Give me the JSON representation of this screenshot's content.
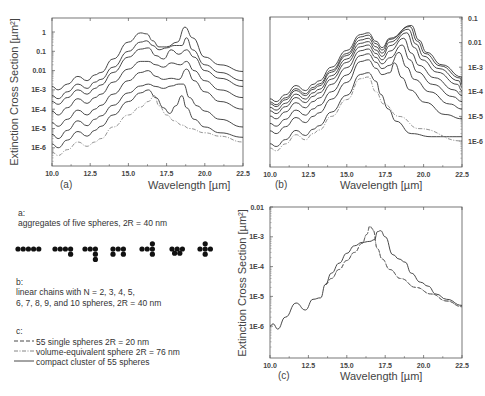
{
  "chart_data": [
    {
      "id": "a",
      "type": "line",
      "panel_label": "(a)",
      "xlabel": "Wavelength [µm]",
      "ylabel": "Extinction Cross Section [µm²]",
      "xlim": [
        10.0,
        22.5
      ],
      "yscale": "log",
      "ylim": [
        3e-07,
        3
      ],
      "x_ticks": [
        "10.0",
        "12.5",
        "15.0",
        "17.5",
        "20.0",
        "22.5"
      ],
      "y_ticks": [
        "1",
        "0.1",
        "0.01",
        "1E-3",
        "1E-4",
        "1E-5",
        "1E-6"
      ],
      "y_axis_side": "left",
      "note": "aggregates of five spheres, curves vertically offset by decades",
      "series": [
        {
          "name": "aggregate 1",
          "style": "solid",
          "x": [
            10.0,
            10.4,
            11.0,
            11.7,
            12.3,
            12.8,
            13.2,
            14.0,
            15.0,
            15.8,
            16.2,
            16.6,
            17.0,
            17.5,
            18.2,
            18.7,
            19.2,
            20.0,
            21.0,
            22.5
          ],
          "y": [
            0.0015,
            0.001,
            0.002,
            0.005,
            0.003,
            0.006,
            0.008,
            0.04,
            0.3,
            0.9,
            0.8,
            0.35,
            0.17,
            0.17,
            0.3,
            1.8,
            0.5,
            0.05,
            0.02,
            0.009
          ]
        },
        {
          "name": "aggregate 2",
          "style": "solid",
          "x": [
            10.0,
            10.4,
            11.0,
            11.7,
            12.3,
            12.8,
            13.2,
            14.0,
            15.0,
            15.8,
            16.2,
            16.6,
            17.0,
            17.5,
            18.0,
            18.5,
            18.8,
            19.2,
            20.0,
            21.0,
            22.5
          ],
          "y": [
            0.0005,
            0.00035,
            0.0008,
            0.002,
            0.0012,
            0.0025,
            0.0035,
            0.015,
            0.1,
            0.3,
            0.35,
            0.2,
            0.12,
            0.15,
            0.2,
            0.2,
            0.5,
            0.12,
            0.02,
            0.008,
            0.003
          ]
        },
        {
          "name": "aggregate 3",
          "style": "solid",
          "x": [
            10.0,
            10.4,
            11.0,
            11.7,
            12.3,
            12.8,
            13.2,
            14.0,
            15.0,
            15.8,
            16.3,
            16.8,
            17.3,
            17.8,
            18.3,
            18.8,
            19.3,
            20.0,
            21.0,
            22.5
          ],
          "y": [
            0.00025,
            0.00018,
            0.0004,
            0.001,
            0.0006,
            0.0012,
            0.0018,
            0.008,
            0.05,
            0.13,
            0.15,
            0.06,
            0.04,
            0.12,
            0.07,
            0.12,
            0.05,
            0.01,
            0.004,
            0.0015
          ]
        },
        {
          "name": "aggregate 4",
          "style": "solid",
          "x": [
            10.0,
            10.4,
            11.0,
            11.7,
            12.3,
            12.8,
            13.2,
            14.0,
            15.0,
            15.8,
            16.3,
            16.8,
            17.3,
            17.8,
            18.4,
            18.8,
            19.3,
            20.0,
            21.0,
            22.5
          ],
          "y": [
            8e-05,
            5e-05,
            0.00012,
            0.00035,
            0.0002,
            0.0004,
            0.0006,
            0.0025,
            0.012,
            0.03,
            0.03,
            0.02,
            0.015,
            0.025,
            0.02,
            0.03,
            0.01,
            0.003,
            0.001,
            0.0004
          ]
        },
        {
          "name": "aggregate 5",
          "style": "solid",
          "x": [
            10.0,
            10.4,
            11.0,
            11.7,
            12.3,
            12.8,
            13.2,
            14.0,
            15.0,
            15.8,
            16.3,
            16.8,
            17.3,
            17.8,
            18.3,
            18.8,
            19.3,
            20.0,
            21.0,
            22.5
          ],
          "y": [
            2e-05,
            1.3e-05,
            3e-05,
            9e-05,
            5e-05,
            0.0001,
            0.00016,
            0.0006,
            0.003,
            0.008,
            0.01,
            0.005,
            0.0035,
            0.004,
            0.0035,
            0.012,
            0.003,
            0.0008,
            0.00025,
            0.0001
          ]
        },
        {
          "name": "aggregate 6",
          "style": "solid",
          "x": [
            10.0,
            10.4,
            11.0,
            11.7,
            12.3,
            12.8,
            13.2,
            14.0,
            15.0,
            15.8,
            16.3,
            16.8,
            17.3,
            17.8,
            18.3,
            18.6,
            19.0,
            19.5,
            20.0,
            21.0,
            22.5
          ],
          "y": [
            5e-06,
            3e-06,
            8e-06,
            2.5e-05,
            1.4e-05,
            3e-05,
            4.5e-05,
            0.00016,
            0.0007,
            0.0016,
            0.002,
            0.0015,
            0.0012,
            0.0016,
            0.002,
            0.002,
            0.0004,
            0.00015,
            8e-05,
            3e-05,
            1.2e-05
          ]
        },
        {
          "name": "aggregate 7 (chain)",
          "style": "solid",
          "x": [
            10.0,
            10.4,
            11.0,
            11.7,
            12.3,
            12.8,
            13.2,
            14.0,
            15.0,
            15.8,
            16.3,
            16.8,
            17.3,
            17.7,
            18.1,
            18.5,
            18.8,
            19.3,
            20.0,
            21.0,
            22.5
          ],
          "y": [
            1.6e-06,
            1e-06,
            2.5e-06,
            7e-06,
            4e-06,
            8e-06,
            1.3e-05,
            5e-05,
            0.00025,
            0.0007,
            0.001,
            0.0004,
            0.00012,
            6e-05,
            0.00015,
            0.0005,
            0.00012,
            3e-05,
            1.2e-05,
            6e-06,
            3.5e-06
          ]
        },
        {
          "name": "reference sphere",
          "style": "dashdot",
          "x": [
            10.0,
            10.4,
            11.0,
            11.7,
            12.3,
            12.8,
            13.2,
            14.0,
            15.0,
            15.8,
            16.3,
            16.7,
            17.0,
            17.5,
            18.0,
            18.5,
            19.0,
            20.0,
            21.0,
            22.5
          ],
          "y": [
            6e-07,
            4e-07,
            8e-07,
            2e-06,
            1.2e-06,
            2e-06,
            3e-06,
            1.2e-05,
            5e-05,
            0.00013,
            0.00025,
            0.0005,
            0.00015,
            5e-05,
            2.5e-05,
            1.5e-05,
            1e-05,
            6e-06,
            4e-06,
            2e-06
          ]
        }
      ]
    },
    {
      "id": "b",
      "type": "line",
      "panel_label": "(b)",
      "xlabel": "Wavelength [µm]",
      "ylabel": "",
      "xlim": [
        10.0,
        22.5
      ],
      "yscale": "log",
      "ylim": [
        2e-07,
        0.1
      ],
      "x_ticks": [
        "10.0",
        "12.5",
        "15.0",
        "17.5",
        "20.0",
        "22.5"
      ],
      "y_ticks": [
        "0.1",
        "0.01",
        "1E-3",
        "1E-4",
        "1E-5",
        "1E-6"
      ],
      "y_axis_side": "right",
      "note": "linear chains with N = 2..10 spheres",
      "series": [
        {
          "name": "N=10",
          "style": "solid",
          "peak_x": 19.2,
          "peak_y": 0.05,
          "hump_y": 0.025,
          "base_y": 4e-05,
          "tail_y": 0.00025
        },
        {
          "name": "N=9",
          "style": "solid",
          "peak_x": 19.1,
          "peak_y": 0.045,
          "hump_y": 0.02,
          "base_y": 3e-05,
          "tail_y": 0.0002
        },
        {
          "name": "N=8",
          "style": "solid",
          "peak_x": 19.0,
          "peak_y": 0.035,
          "hump_y": 0.015,
          "base_y": 2.5e-05,
          "tail_y": 0.00015
        },
        {
          "name": "N=7",
          "style": "solid",
          "peak_x": 18.9,
          "peak_y": 0.025,
          "hump_y": 0.011,
          "base_y": 1.8e-05,
          "tail_y": 0.00011
        },
        {
          "name": "N=6",
          "style": "solid",
          "peak_x": 18.7,
          "peak_y": 0.015,
          "hump_y": 0.008,
          "base_y": 1.3e-05,
          "tail_y": 7e-05
        },
        {
          "name": "N=5",
          "style": "solid",
          "peak_x": 18.6,
          "peak_y": 0.008,
          "hump_y": 0.0055,
          "base_y": 8e-06,
          "tail_y": 4e-05
        },
        {
          "name": "N=4",
          "style": "solid",
          "peak_x": 18.4,
          "peak_y": 0.004,
          "hump_y": 0.0035,
          "base_y": 4e-06,
          "tail_y": 2e-05
        },
        {
          "name": "N=3",
          "style": "solid",
          "peak_x": 18.1,
          "peak_y": 0.0015,
          "hump_y": 0.002,
          "base_y": 2e-06,
          "tail_y": 8e-06
        },
        {
          "name": "N=2",
          "style": "solid",
          "peak_x": 17.2,
          "peak_y": 8e-05,
          "hump_y": 0.0006,
          "base_y": 6e-07,
          "tail_y": 1.5e-06
        },
        {
          "name": "single sphere",
          "style": "dashdot",
          "peak_x": 16.4,
          "peak_y": 0.0004,
          "hump_y": 0.0004,
          "base_y": 4e-07,
          "tail_y": 1e-06
        }
      ]
    },
    {
      "id": "c",
      "type": "line",
      "panel_label": "(c)",
      "xlabel": "Wavelength [µm]",
      "ylabel": "Extinction Cross Section [µm²]",
      "xlim": [
        10.0,
        22.5
      ],
      "yscale": "log",
      "ylim": [
        1e-07,
        0.01
      ],
      "x_ticks": [
        "10.0",
        "12.5",
        "15.0",
        "17.5",
        "20.0",
        "22.5"
      ],
      "y_ticks": [
        "0.01",
        "1E-3",
        "1E-4",
        "1E-5",
        "1E-6"
      ],
      "y_axis_side": "left",
      "series": [
        {
          "name": "55 single spheres 2R = 20 nm",
          "style": "dashed",
          "x": [
            13.6,
            14.0,
            14.5,
            15.0,
            15.5,
            16.0,
            16.3,
            16.5,
            16.7,
            17.0,
            17.3,
            17.8,
            18.5,
            19.5,
            20.5,
            21.5,
            22.5
          ],
          "y": [
            2.5e-05,
            4e-05,
            8e-05,
            0.00016,
            0.0003,
            0.0006,
            0.0012,
            0.0023,
            0.0018,
            0.0004,
            0.00018,
            8e-05,
            4e-05,
            2e-05,
            1.2e-05,
            7e-06,
            4.5e-06
          ]
        },
        {
          "name": "volume-equivalent sphere 2R = 76 nm",
          "style": "dashdot",
          "x": [
            13.6,
            14.0,
            14.5,
            15.0,
            15.5,
            16.0,
            16.3,
            16.5,
            16.7,
            17.0,
            17.3,
            17.8,
            18.5,
            19.5,
            20.5,
            21.5,
            22.5
          ],
          "y": [
            2.5e-05,
            4e-05,
            8e-05,
            0.00016,
            0.0003,
            0.0006,
            0.0012,
            0.0022,
            0.0017,
            0.0004,
            0.00018,
            8e-05,
            4e-05,
            2e-05,
            1.2e-05,
            7e-06,
            4.5e-06
          ]
        },
        {
          "name": "compact cluster of 55 spheres",
          "style": "solid",
          "x": [
            10.0,
            10.2,
            10.5,
            11.0,
            11.7,
            12.3,
            12.8,
            13.3,
            13.6,
            14.0,
            14.5,
            15.0,
            15.5,
            16.0,
            16.5,
            16.8,
            17.0,
            17.2,
            17.5,
            18.0,
            18.4,
            18.8,
            19.2,
            19.8,
            20.3,
            20.8,
            21.5,
            22.5
          ],
          "y": [
            1e-06,
            1.2e-06,
            8e-07,
            2e-06,
            6e-06,
            3.5e-06,
            8e-06,
            9e-06,
            2.5e-05,
            6e-05,
            0.00013,
            0.00028,
            0.0005,
            0.00065,
            0.0007,
            0.0008,
            0.0015,
            0.0016,
            0.001,
            0.00025,
            0.00018,
            0.00014,
            6e-05,
            3e-05,
            2.2e-05,
            1.2e-05,
            8e-06,
            5e-06
          ]
        }
      ]
    }
  ],
  "legend": {
    "a_heading": "a:",
    "a_text": "aggregates of five spheres, 2R = 40 nm",
    "b_heading": "b:",
    "b_text_line1": "linear chains with N = 2, 3, 4, 5,",
    "b_text_line2": "6, 7, 8, 9, and 10 spheres, 2R = 40 nm",
    "c_heading": "c:",
    "c_items": [
      {
        "style": "dashed",
        "label": "55 single spheres 2R = 20 nm"
      },
      {
        "style": "dashdot",
        "label": "volume-equivalent sphere 2R = 76 nm"
      },
      {
        "style": "solid",
        "label": "compact cluster of 55 spheres"
      }
    ],
    "aggregate_shapes": [
      {
        "name": "linear-chain",
        "cells": [
          [
            0,
            0
          ],
          [
            1,
            0
          ],
          [
            2,
            0
          ],
          [
            3,
            0
          ],
          [
            4,
            0
          ]
        ]
      },
      {
        "name": "chain-bent-end",
        "cells": [
          [
            0,
            0
          ],
          [
            1,
            0
          ],
          [
            2,
            0
          ],
          [
            3,
            0
          ],
          [
            3,
            1
          ]
        ]
      },
      {
        "name": "chain-L",
        "cells": [
          [
            0,
            0
          ],
          [
            1,
            0
          ],
          [
            2,
            0
          ],
          [
            2,
            1
          ],
          [
            2,
            2
          ]
        ]
      },
      {
        "name": "zigzag",
        "cells": [
          [
            0,
            0
          ],
          [
            0,
            1
          ],
          [
            1,
            0
          ],
          [
            2,
            0
          ],
          [
            2,
            1
          ]
        ]
      },
      {
        "name": "T-shape",
        "cells": [
          [
            0,
            0
          ],
          [
            1,
            0
          ],
          [
            2,
            -1
          ],
          [
            2,
            0
          ],
          [
            2,
            1
          ]
        ]
      },
      {
        "name": "compact",
        "cells": [
          [
            0,
            0
          ],
          [
            1,
            0
          ],
          [
            2,
            0
          ],
          [
            0.5,
            0.8
          ],
          [
            1.5,
            0.8
          ]
        ]
      },
      {
        "name": "cross",
        "cells": [
          [
            1,
            -1
          ],
          [
            0,
            0
          ],
          [
            1,
            0
          ],
          [
            2,
            0
          ],
          [
            1,
            1
          ]
        ]
      }
    ]
  }
}
